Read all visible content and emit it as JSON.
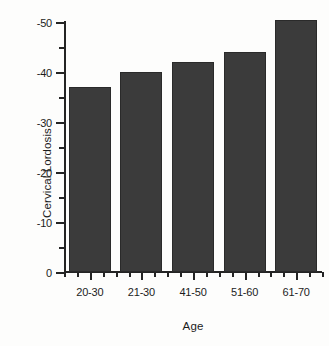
{
  "chart_data": {
    "type": "bar",
    "title": "",
    "xlabel": "Age",
    "ylabel": "Cervical Lordosis",
    "categories": [
      "20-30",
      "21-30",
      "41-50",
      "51-60",
      "61-70"
    ],
    "values": [
      -37,
      -40,
      -42,
      -44,
      -50.5
    ],
    "series": [
      {
        "name": "Cervical Lordosis",
        "values": [
          -37,
          -40,
          -42,
          -44,
          -50.5
        ]
      }
    ],
    "ylim": [
      0,
      -52
    ],
    "y_major_ticks": [
      0,
      -10,
      -20,
      -30,
      -40,
      -50
    ],
    "y_tick_labels": [
      "0",
      "-10",
      "-20",
      "-30",
      "-40",
      "-50"
    ],
    "y_minor_ticks": [
      -5,
      -15,
      -25,
      -35,
      -45
    ],
    "y_axis_direction": "inverted",
    "grid": "off",
    "legend": "none",
    "bar_color": "#3b3b3b",
    "axis_color": "#242424",
    "background_color": "#fdfdfc"
  }
}
